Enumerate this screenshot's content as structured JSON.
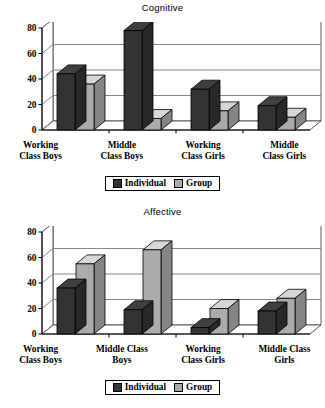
{
  "figure": {
    "legend": {
      "individual_label": "Individual",
      "group_label": "Group",
      "individual_color": "#333333",
      "group_color": "#ababab"
    },
    "axis": {
      "ticks": [
        "0",
        "20",
        "40",
        "60",
        "80"
      ],
      "ymin": 0,
      "ymax": 80
    }
  },
  "chart_data": [
    {
      "type": "bar",
      "title": "Cognitive",
      "xlabel": "",
      "ylabel": "",
      "ylim": [
        0,
        80
      ],
      "yticks": [
        0,
        20,
        40,
        60,
        80
      ],
      "grid": true,
      "legend_position": "bottom",
      "categories": [
        "Working Class Boys",
        "Middle Class Boys",
        "Working Class Girls",
        "Middle Class Girls"
      ],
      "category_lines": [
        [
          "Working",
          "Class Boys"
        ],
        [
          "Middle",
          "Class Boys"
        ],
        [
          "Working",
          "Class Girls"
        ],
        [
          "Middle",
          "Class Girls"
        ]
      ],
      "series": [
        {
          "name": "Individual",
          "values": [
            44,
            78,
            32,
            19
          ]
        },
        {
          "name": "Group",
          "values": [
            36,
            9,
            15,
            10
          ]
        }
      ]
    },
    {
      "type": "bar",
      "title": "Affective",
      "xlabel": "",
      "ylabel": "",
      "ylim": [
        0,
        80
      ],
      "yticks": [
        0,
        20,
        40,
        60,
        80
      ],
      "grid": true,
      "legend_position": "bottom",
      "categories": [
        "Working Class Boys",
        "Middle Class Boys",
        "Working Class Girls",
        "Middle Class Girls"
      ],
      "category_lines": [
        [
          "Working",
          "Class Boys"
        ],
        [
          "Middle Class",
          "Boys"
        ],
        [
          "Working",
          "Class Girls"
        ],
        [
          "Middle Class",
          "Girls"
        ]
      ],
      "series": [
        {
          "name": "Individual",
          "values": [
            36,
            19,
            5,
            18
          ]
        },
        {
          "name": "Group",
          "values": [
            55,
            66,
            20,
            28
          ]
        }
      ]
    }
  ]
}
